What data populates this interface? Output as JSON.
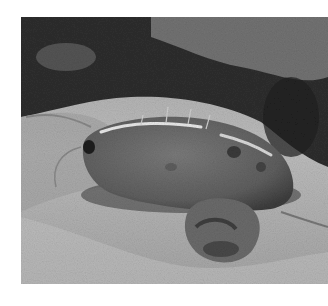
{
  "image": {
    "description": "Grayscale close-up photograph of a small crustacean (isopod/amphipod) on a sandy substrate with dark vegetation/rock behind it and a clump of debris in front",
    "subject": "crustacean",
    "colors": {
      "background_page": "#ffffff",
      "dark_vegetation": "#2a2a2a",
      "sand": "#b8b8b8",
      "body": "#6a6a6a",
      "highlight": "#e8e8e8"
    }
  }
}
